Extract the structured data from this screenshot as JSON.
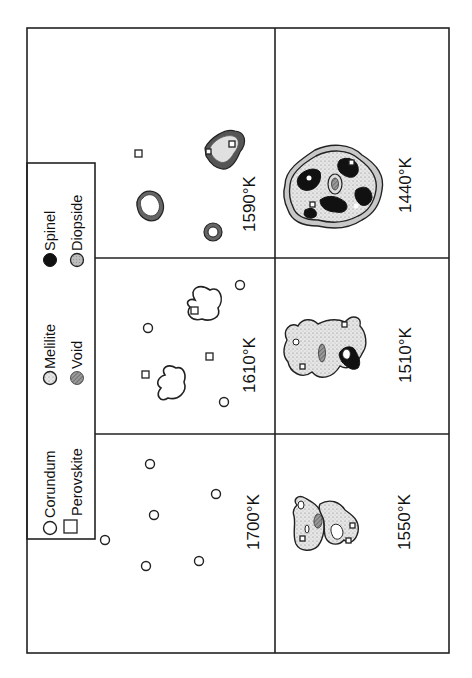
{
  "legend": {
    "items": [
      {
        "symbol": "open-circle",
        "label": "Corundum"
      },
      {
        "symbol": "open-square",
        "label": "Perovskite"
      },
      {
        "symbol": "stippled-circle",
        "label": "Melilite"
      },
      {
        "symbol": "hatched-circle",
        "label": "Void"
      },
      {
        "symbol": "filled-circle",
        "label": "Spinel"
      },
      {
        "symbol": "gray-circle",
        "label": "Diopside"
      }
    ]
  },
  "panels": [
    {
      "id": "panel-1700",
      "temperature": "1700°K",
      "phases": [
        "Corundum"
      ]
    },
    {
      "id": "panel-1610",
      "temperature": "1610°K",
      "phases": [
        "Corundum",
        "Perovskite",
        "Melilite outline"
      ]
    },
    {
      "id": "panel-1590",
      "temperature": "1590°K",
      "phases": [
        "Perovskite",
        "Melilite",
        "Diopside rim"
      ]
    },
    {
      "id": "panel-1550",
      "temperature": "1550°K",
      "phases": [
        "Melilite",
        "Void",
        "Perovskite"
      ]
    },
    {
      "id": "panel-1510",
      "temperature": "1510°K",
      "phases": [
        "Melilite",
        "Void",
        "Spinel",
        "Perovskite"
      ]
    },
    {
      "id": "panel-1440",
      "temperature": "1440°K",
      "phases": [
        "Melilite",
        "Spinel",
        "Diopside",
        "Void",
        "Perovskite"
      ]
    }
  ],
  "colors": {
    "line": "#222222",
    "spinel": "#111111",
    "stipple_bg": "#e4e4e4",
    "diopside": "#bdbdbd",
    "background": "#ffffff"
  }
}
